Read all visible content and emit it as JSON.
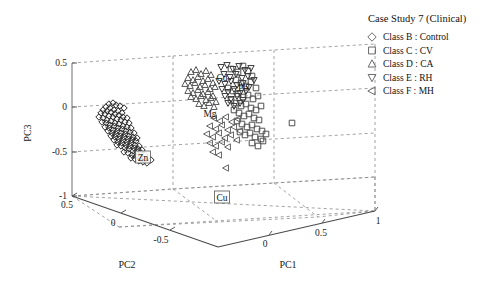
{
  "legend": {
    "title": "Case Study 7 (Clinical)",
    "items": [
      {
        "marker": "diamond",
        "label": "Class B : Control"
      },
      {
        "marker": "square",
        "label": "Class C : CV"
      },
      {
        "marker": "triangle-up",
        "label": "Class D : CA"
      },
      {
        "marker": "triangle-down",
        "label": "Class E : RH"
      },
      {
        "marker": "triangle-left",
        "label": "Class F : MH"
      }
    ]
  },
  "annotations": [
    {
      "text": "Zn",
      "x": 143,
      "y": 157,
      "boxed": true
    },
    {
      "text": "Mg",
      "x": 210,
      "y": 113,
      "boxed": false
    },
    {
      "text": "Cd",
      "x": 222,
      "y": 77,
      "boxed": false
    },
    {
      "text": "Pb",
      "x": 243,
      "y": 87,
      "boxed": false
    },
    {
      "text": "Cu",
      "x": 222,
      "y": 197,
      "boxed": true
    }
  ],
  "chart_data": {
    "type": "scatter",
    "title": "Case Study 7 (Clinical)",
    "projection": "3d",
    "xlabel": "PC1",
    "ylabel": "PC2",
    "zlabel": "PC3",
    "xlim": [
      -0.5,
      1.0
    ],
    "ylim": [
      -0.75,
      0.5
    ],
    "zlim": [
      -1.0,
      0.5
    ],
    "xticks": [
      0,
      0.5,
      1
    ],
    "xticklabels": [
      "0",
      "0.5",
      "1"
    ],
    "yticks": [
      0.5,
      0,
      -0.5
    ],
    "yticklabels": [
      "0.5",
      "0",
      "-0.5"
    ],
    "zticks": [
      0.5,
      0,
      -0.5,
      -1
    ],
    "zticklabels": [
      "0.5",
      "0",
      "-0.5",
      "-1"
    ],
    "grid": true,
    "legend_position": "upper-right-outside",
    "variable_loadings": [
      "Zn",
      "Mg",
      "Cd",
      "Pb",
      "Cu"
    ],
    "series": [
      {
        "name": "Class B : Control",
        "marker": "diamond",
        "color": "#2b2b2b",
        "n": 96,
        "points_px": [
          [
            109,
            104
          ],
          [
            113,
            103
          ],
          [
            116,
            105
          ],
          [
            120,
            106
          ],
          [
            124,
            108
          ],
          [
            106,
            107
          ],
          [
            110,
            108
          ],
          [
            114,
            110
          ],
          [
            118,
            111
          ],
          [
            122,
            113
          ],
          [
            103,
            110
          ],
          [
            107,
            111
          ],
          [
            111,
            112
          ],
          [
            115,
            114
          ],
          [
            119,
            115
          ],
          [
            123,
            117
          ],
          [
            127,
            118
          ],
          [
            101,
            113
          ],
          [
            105,
            114
          ],
          [
            109,
            116
          ],
          [
            113,
            117
          ],
          [
            117,
            119
          ],
          [
            121,
            120
          ],
          [
            125,
            122
          ],
          [
            129,
            123
          ],
          [
            99,
            117
          ],
          [
            103,
            118
          ],
          [
            107,
            120
          ],
          [
            111,
            121
          ],
          [
            115,
            123
          ],
          [
            119,
            124
          ],
          [
            123,
            126
          ],
          [
            127,
            127
          ],
          [
            131,
            128
          ],
          [
            102,
            122
          ],
          [
            106,
            123
          ],
          [
            110,
            125
          ],
          [
            114,
            126
          ],
          [
            118,
            128
          ],
          [
            122,
            129
          ],
          [
            126,
            131
          ],
          [
            130,
            132
          ],
          [
            134,
            133
          ],
          [
            105,
            127
          ],
          [
            109,
            128
          ],
          [
            113,
            130
          ],
          [
            117,
            131
          ],
          [
            121,
            133
          ],
          [
            125,
            134
          ],
          [
            129,
            136
          ],
          [
            133,
            137
          ],
          [
            137,
            138
          ],
          [
            108,
            131
          ],
          [
            112,
            133
          ],
          [
            116,
            134
          ],
          [
            120,
            136
          ],
          [
            124,
            137
          ],
          [
            128,
            139
          ],
          [
            132,
            140
          ],
          [
            136,
            141
          ],
          [
            111,
            136
          ],
          [
            115,
            137
          ],
          [
            119,
            139
          ],
          [
            123,
            140
          ],
          [
            127,
            142
          ],
          [
            131,
            143
          ],
          [
            135,
            145
          ],
          [
            139,
            146
          ],
          [
            114,
            140
          ],
          [
            118,
            142
          ],
          [
            122,
            143
          ],
          [
            126,
            145
          ],
          [
            130,
            146
          ],
          [
            134,
            148
          ],
          [
            138,
            149
          ],
          [
            142,
            150
          ],
          [
            117,
            145
          ],
          [
            121,
            146
          ],
          [
            125,
            148
          ],
          [
            129,
            149
          ],
          [
            133,
            151
          ],
          [
            137,
            152
          ],
          [
            141,
            153
          ],
          [
            145,
            155
          ],
          [
            124,
            152
          ],
          [
            128,
            153
          ],
          [
            132,
            155
          ],
          [
            136,
            156
          ],
          [
            140,
            158
          ],
          [
            144,
            159
          ],
          [
            131,
            158
          ],
          [
            135,
            159
          ],
          [
            139,
            161
          ],
          [
            143,
            162
          ],
          [
            147,
            163
          ],
          [
            151,
            160
          ]
        ]
      },
      {
        "name": "Class C : CV",
        "marker": "square",
        "color": "#4f4f4f",
        "n": 46,
        "points_px": [
          [
            231,
            69
          ],
          [
            238,
            72
          ],
          [
            243,
            66
          ],
          [
            248,
            71
          ],
          [
            252,
            76
          ],
          [
            236,
            80
          ],
          [
            241,
            83
          ],
          [
            246,
            86
          ],
          [
            251,
            82
          ],
          [
            256,
            88
          ],
          [
            228,
            88
          ],
          [
            233,
            91
          ],
          [
            238,
            94
          ],
          [
            243,
            97
          ],
          [
            248,
            95
          ],
          [
            253,
            99
          ],
          [
            258,
            96
          ],
          [
            231,
            100
          ],
          [
            236,
            103
          ],
          [
            241,
            106
          ],
          [
            246,
            104
          ],
          [
            251,
            108
          ],
          [
            256,
            110
          ],
          [
            261,
            106
          ],
          [
            234,
            110
          ],
          [
            239,
            113
          ],
          [
            244,
            116
          ],
          [
            249,
            114
          ],
          [
            254,
            118
          ],
          [
            259,
            120
          ],
          [
            237,
            121
          ],
          [
            242,
            124
          ],
          [
            247,
            127
          ],
          [
            252,
            125
          ],
          [
            257,
            129
          ],
          [
            262,
            131
          ],
          [
            240,
            132
          ],
          [
            245,
            135
          ],
          [
            250,
            133
          ],
          [
            255,
            137
          ],
          [
            261,
            139
          ],
          [
            266,
            134
          ],
          [
            252,
            143
          ],
          [
            258,
            146
          ],
          [
            263,
            141
          ],
          [
            292,
            123
          ]
        ]
      },
      {
        "name": "Class D : CA",
        "marker": "triangle-up",
        "color": "#555555",
        "n": 34,
        "points_px": [
          [
            191,
            72
          ],
          [
            196,
            70
          ],
          [
            201,
            74
          ],
          [
            206,
            71
          ],
          [
            211,
            75
          ],
          [
            188,
            78
          ],
          [
            193,
            80
          ],
          [
            198,
            77
          ],
          [
            203,
            81
          ],
          [
            208,
            79
          ],
          [
            213,
            83
          ],
          [
            185,
            84
          ],
          [
            190,
            86
          ],
          [
            195,
            83
          ],
          [
            200,
            87
          ],
          [
            205,
            85
          ],
          [
            210,
            89
          ],
          [
            215,
            87
          ],
          [
            188,
            91
          ],
          [
            193,
            93
          ],
          [
            198,
            90
          ],
          [
            203,
            94
          ],
          [
            208,
            92
          ],
          [
            213,
            96
          ],
          [
            191,
            97
          ],
          [
            196,
            99
          ],
          [
            201,
            96
          ],
          [
            206,
            100
          ],
          [
            211,
            98
          ],
          [
            216,
            102
          ],
          [
            199,
            104
          ],
          [
            204,
            106
          ],
          [
            209,
            103
          ],
          [
            214,
            107
          ]
        ]
      },
      {
        "name": "Class E : RH",
        "marker": "triangle-down",
        "color": "#3a3a3a",
        "n": 30,
        "points_px": [
          [
            221,
            67
          ],
          [
            227,
            65
          ],
          [
            233,
            69
          ],
          [
            239,
            66
          ],
          [
            245,
            70
          ],
          [
            251,
            68
          ],
          [
            224,
            74
          ],
          [
            230,
            77
          ],
          [
            236,
            74
          ],
          [
            242,
            78
          ],
          [
            248,
            76
          ],
          [
            254,
            80
          ],
          [
            219,
            81
          ],
          [
            225,
            84
          ],
          [
            231,
            81
          ],
          [
            237,
            85
          ],
          [
            243,
            83
          ],
          [
            249,
            87
          ],
          [
            222,
            89
          ],
          [
            228,
            92
          ],
          [
            234,
            89
          ],
          [
            240,
            93
          ],
          [
            246,
            91
          ],
          [
            225,
            96
          ],
          [
            231,
            99
          ],
          [
            237,
            96
          ],
          [
            243,
            100
          ],
          [
            228,
            103
          ],
          [
            234,
            106
          ],
          [
            240,
            103
          ]
        ]
      },
      {
        "name": "Class F : MH",
        "marker": "triangle-left",
        "color": "#636363",
        "n": 24,
        "points_px": [
          [
            214,
            118
          ],
          [
            220,
            121
          ],
          [
            226,
            117
          ],
          [
            232,
            122
          ],
          [
            238,
            119
          ],
          [
            210,
            126
          ],
          [
            216,
            129
          ],
          [
            222,
            125
          ],
          [
            228,
            130
          ],
          [
            234,
            127
          ],
          [
            240,
            131
          ],
          [
            207,
            134
          ],
          [
            213,
            137
          ],
          [
            219,
            133
          ],
          [
            225,
            138
          ],
          [
            231,
            135
          ],
          [
            237,
            140
          ],
          [
            210,
            143
          ],
          [
            216,
            146
          ],
          [
            222,
            142
          ],
          [
            228,
            147
          ],
          [
            213,
            152
          ],
          [
            219,
            155
          ],
          [
            226,
            168
          ]
        ]
      }
    ]
  }
}
